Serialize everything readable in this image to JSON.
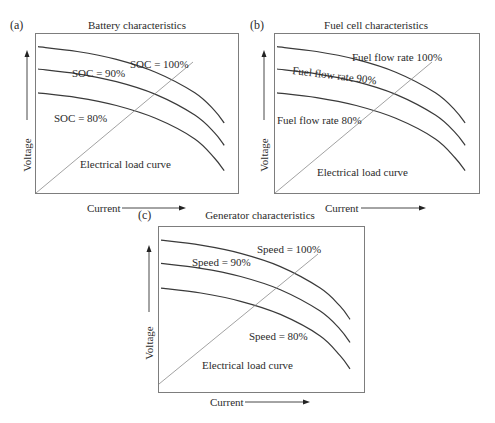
{
  "figure": {
    "panels": [
      {
        "tag": "(a)",
        "title": "Battery characteristics",
        "xlabel": "Current",
        "ylabel": "Voltage",
        "load_curve_label": "Electrical load curve",
        "curve_labels": [
          "SOC = 100%",
          "SOC = 90%",
          "SOC = 80%"
        ]
      },
      {
        "tag": "(b)",
        "title": "Fuel cell characteristics",
        "xlabel": "Current",
        "ylabel": "Voltage",
        "load_curve_label": "Electrical load curve",
        "curve_labels": [
          "Fuel flow rate 100%",
          "Fuel flow rate 90%",
          "Fuel flow rate 80%"
        ]
      },
      {
        "tag": "(c)",
        "title": "Generator characteristics",
        "xlabel": "Current",
        "ylabel": "Voltage",
        "load_curve_label": "Electrical load curve",
        "curve_labels": [
          "Speed = 100%",
          "Speed = 90%",
          "Speed = 80%"
        ]
      }
    ]
  },
  "chart_data": [
    {
      "type": "line",
      "title": "Battery characteristics",
      "xlabel": "Current",
      "ylabel": "Voltage",
      "grid": false,
      "axis_ticks": "none (qualitative)",
      "x": [
        0,
        0.2,
        0.4,
        0.6,
        0.8,
        0.9,
        0.95
      ],
      "series": [
        {
          "name": "SOC = 100%",
          "values": [
            0.92,
            0.89,
            0.84,
            0.76,
            0.63,
            0.52,
            0.44
          ]
        },
        {
          "name": "SOC = 90%",
          "values": [
            0.78,
            0.75,
            0.7,
            0.62,
            0.49,
            0.38,
            0.3
          ]
        },
        {
          "name": "SOC = 80%",
          "values": [
            0.63,
            0.6,
            0.55,
            0.47,
            0.34,
            0.22,
            0.14
          ]
        },
        {
          "name": "Electrical load curve",
          "values": [
            0.0,
            0.18,
            0.36,
            0.54,
            0.72,
            0.81,
            0.86
          ]
        }
      ]
    },
    {
      "type": "line",
      "title": "Fuel cell characteristics",
      "xlabel": "Current",
      "ylabel": "Voltage",
      "grid": false,
      "axis_ticks": "none (qualitative)",
      "x": [
        0,
        0.2,
        0.4,
        0.6,
        0.8,
        0.9,
        0.95
      ],
      "series": [
        {
          "name": "Fuel flow rate 100%",
          "values": [
            0.92,
            0.89,
            0.84,
            0.76,
            0.63,
            0.52,
            0.44
          ]
        },
        {
          "name": "Fuel flow rate 90%",
          "values": [
            0.78,
            0.75,
            0.7,
            0.62,
            0.49,
            0.38,
            0.3
          ]
        },
        {
          "name": "Fuel flow rate 80%",
          "values": [
            0.63,
            0.6,
            0.55,
            0.47,
            0.34,
            0.22,
            0.14
          ]
        },
        {
          "name": "Electrical load curve",
          "values": [
            0.0,
            0.18,
            0.36,
            0.54,
            0.72,
            0.81,
            0.86
          ]
        }
      ]
    },
    {
      "type": "line",
      "title": "Generator characteristics",
      "xlabel": "Current",
      "ylabel": "Voltage",
      "grid": false,
      "axis_ticks": "none (qualitative)",
      "x": [
        0,
        0.2,
        0.4,
        0.6,
        0.8,
        0.9,
        0.95
      ],
      "series": [
        {
          "name": "Speed = 100%",
          "values": [
            0.92,
            0.89,
            0.84,
            0.76,
            0.63,
            0.52,
            0.44
          ]
        },
        {
          "name": "Speed = 90%",
          "values": [
            0.78,
            0.75,
            0.7,
            0.62,
            0.49,
            0.38,
            0.3
          ]
        },
        {
          "name": "Speed = 80%",
          "values": [
            0.63,
            0.6,
            0.55,
            0.47,
            0.34,
            0.22,
            0.14
          ]
        },
        {
          "name": "Electrical load curve",
          "values": [
            0.05,
            0.22,
            0.39,
            0.56,
            0.73,
            0.82,
            0.86
          ]
        }
      ]
    }
  ]
}
